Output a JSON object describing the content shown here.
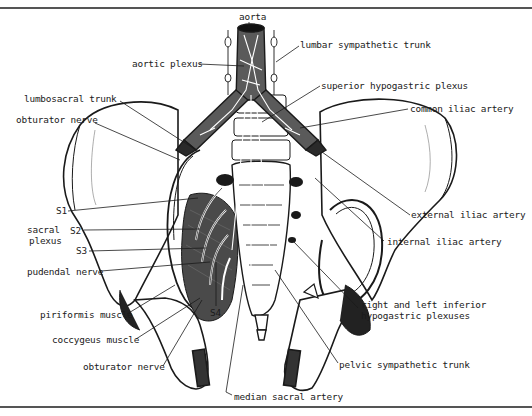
{
  "figure": {
    "colors": {
      "ink": "#1a1a1a",
      "vessel_fill": "#5a5a5a",
      "muscle_fill": "#4a4a4a",
      "bone_fill": "#ffffff",
      "border": "#555555"
    },
    "labels": {
      "aorta": "aorta",
      "aortic_plexus": "aortic plexus",
      "lumbar_sympathetic_trunk": "lumbar sympathetic trunk",
      "superior_hypogastric_plexus": "superior hypogastric plexus",
      "lumbosacral_trunk": "lumbosacral trunk",
      "common_iliac_artery": "common iliac artery",
      "obturator_nerve_upper": "obturator nerve",
      "s1": "S1",
      "sacral_plexus_line1": "sacral",
      "sacral_plexus_line2": "plexus",
      "s2": "S2",
      "s3": "S3",
      "pudendal_nerve": "pudendal nerve",
      "external_iliac_artery": "external iliac artery",
      "internal_iliac_artery": "internal iliac artery",
      "piriformis_muscle": "piriformis muscle",
      "s4": "S4",
      "inferior_hypogastric_line1": "right and left inferior",
      "inferior_hypogastric_line2": "hypogastric plexuses",
      "coccygeus_muscle": "coccygeus muscle",
      "obturator_nerve_lower": "obturator nerve",
      "pelvic_sympathetic_trunk": "pelvic sympathetic trunk",
      "median_sacral_artery": "median sacral artery"
    }
  }
}
